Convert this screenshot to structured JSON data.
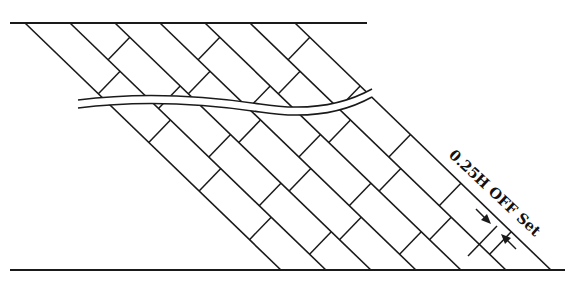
{
  "diagram": {
    "annotation": {
      "label": "0.25H OFF Set",
      "rotation_deg": 43,
      "x": 448,
      "y": 156
    },
    "top_line": {
      "x1": 10,
      "x2": 367,
      "y": 23
    },
    "bottom_line": {
      "x1": 10,
      "x2": 565,
      "y": 270
    },
    "diagonals": {
      "count": 6,
      "top_x_start": 25,
      "spacing": 45,
      "slope_dx_per_dy": 1.036
    },
    "course_height": 45,
    "offset_fraction": 0.25,
    "colors": {
      "ink": "#1a1a1a",
      "background": "#ffffff"
    }
  }
}
